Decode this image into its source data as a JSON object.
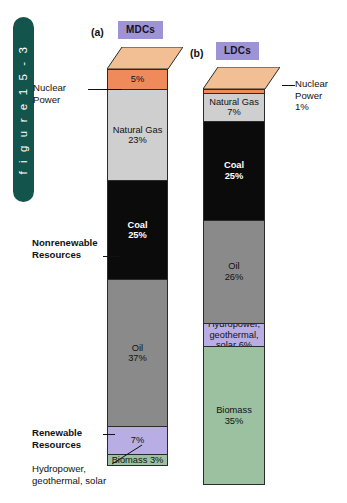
{
  "figure": {
    "tab_label": "f i g u r e   1 5 - 3"
  },
  "panels": [
    {
      "letter": "(a)",
      "tag": "MDCs"
    },
    {
      "letter": "(b)",
      "tag": "LDCs"
    }
  ],
  "callouts": {
    "nuclear_mdc": "Nuclear\nPower",
    "nuclear_ldc": "Nuclear\nPower\n1%",
    "nonrenewable": "Nonrenewable\nResources",
    "renewable": "Renewable\nResources",
    "hydro_footnote": "Hydropower,\ngeothermal, solar"
  },
  "chart_data": {
    "type": "bar",
    "xlabel": "",
    "ylabel": "Share of energy consumption (%)",
    "ylim": [
      0,
      100
    ],
    "grid": false,
    "legend": "none",
    "orientation": "vertical-stacked-3d",
    "categories": [
      "MDCs",
      "LDCs"
    ],
    "group_totals": [
      {
        "category": "MDCs",
        "nonrenewable_pct": 90,
        "renewable_pct": 10,
        "nonrenewable_label": "90%",
        "renewable_label": "10%"
      },
      {
        "category": "LDCs",
        "nonrenewable_pct": 59,
        "renewable_pct": 41,
        "nonrenewable_label": "59%",
        "renewable_label": "41%"
      }
    ],
    "series": [
      {
        "name": "Nuclear Power",
        "values": [
          5,
          1
        ],
        "color": "#ef8a5a",
        "group": "nonrenewable"
      },
      {
        "name": "Natural Gas",
        "values": [
          23,
          7
        ],
        "color": "#cfcfcf",
        "group": "nonrenewable"
      },
      {
        "name": "Coal",
        "values": [
          25,
          25
        ],
        "color": "#0b0b0b",
        "group": "nonrenewable"
      },
      {
        "name": "Oil",
        "values": [
          37,
          26
        ],
        "color": "#8a8a8a",
        "group": "nonrenewable"
      },
      {
        "name": "Hydropower, geothermal, solar",
        "values": [
          7,
          6
        ],
        "color": "#b9aee4",
        "group": "renewable"
      },
      {
        "name": "Biomass",
        "values": [
          3,
          35
        ],
        "color": "#9bc1a1",
        "group": "renewable"
      }
    ],
    "mdc_segments": [
      {
        "label": "5%",
        "value": 5,
        "color": "#ef8a5a",
        "text": "dark",
        "bold": false
      },
      {
        "label": "Natural Gas\n23%",
        "value": 23,
        "color": "#cfcfcf",
        "text": "dark",
        "bold": false
      },
      {
        "label": "Coal\n25%",
        "value": 25,
        "color": "#0b0b0b",
        "text": "light",
        "bold": true
      },
      {
        "label": "Oil\n37%",
        "value": 37,
        "color": "#8a8a8a",
        "text": "dark",
        "bold": false
      },
      {
        "label": "7%",
        "value": 7,
        "color": "#b9aee4",
        "text": "dark",
        "bold": false
      },
      {
        "label": "Biomass 3%",
        "value": 3,
        "color": "#9bc1a1",
        "text": "dark",
        "bold": false
      }
    ],
    "ldc_segments": [
      {
        "label": "",
        "value": 1,
        "color": "#ef8a5a",
        "text": "dark",
        "bold": false
      },
      {
        "label": "Natural Gas\n7%",
        "value": 7,
        "color": "#cfcfcf",
        "text": "dark",
        "bold": false
      },
      {
        "label": "Coal\n25%",
        "value": 25,
        "color": "#0b0b0b",
        "text": "light",
        "bold": true
      },
      {
        "label": "Oil\n26%",
        "value": 26,
        "color": "#8a8a8a",
        "text": "dark",
        "bold": false
      },
      {
        "label": "Hydropower,\ngeothermal,\nsolar 6%",
        "value": 6,
        "color": "#b9aee4",
        "text": "dark",
        "bold": false
      },
      {
        "label": "Biomass\n35%",
        "value": 35,
        "color": "#9bc1a1",
        "text": "dark",
        "bold": false
      }
    ],
    "colors": {
      "nonrenewable_side": "#b03a50",
      "renewable_side": "#2e6a5d",
      "lid": "#f2bf95",
      "tab": "#13544c",
      "tag": "#9e93d6",
      "background": "#ffffff"
    }
  }
}
